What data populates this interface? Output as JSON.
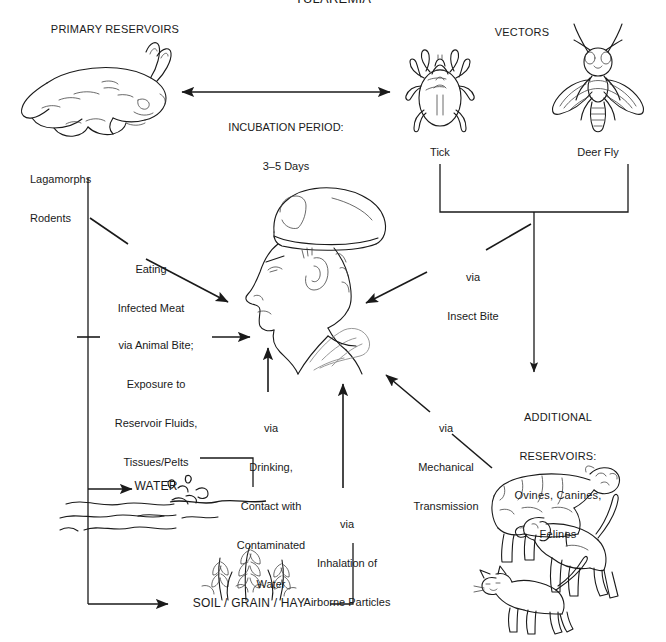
{
  "title": "TULAREMIA",
  "sections": {
    "primary_reservoirs": "PRIMARY RESERVOIRS",
    "vectors": "VECTORS",
    "additional_reservoirs_line1": "ADDITIONAL",
    "additional_reservoirs_line2": "RESERVOIRS:",
    "additional_reservoirs_line3": "Ovines, Canines,",
    "additional_reservoirs_line4": "Felines"
  },
  "nodes": {
    "reservoir_caption_line1": "Lagamorphs",
    "reservoir_caption_line2": "Rodents",
    "tick": "Tick",
    "deer_fly": "Deer Fly",
    "water": "WATER",
    "soil": "SOIL / GRAIN / HAY"
  },
  "edges": {
    "incubation_line1": "INCUBATION PERIOD:",
    "incubation_line2": "3–5 Days",
    "eating_meat_line1": "Eating",
    "eating_meat_line2": "Infected Meat",
    "animal_bite_line1": "via Animal Bite;",
    "animal_bite_line2": "Exposure to",
    "animal_bite_line3": "Reservoir Fluids,",
    "animal_bite_line4": "Tissues/Pelts",
    "drinking_line1": "via",
    "drinking_line2": "Drinking,",
    "drinking_line3": "Contact with",
    "drinking_line4": "Contaminated",
    "drinking_line5": "Water",
    "inhalation_line1": "via",
    "inhalation_line2": "Inhalation of",
    "inhalation_line3": "Airborne Particles",
    "insect_bite_line1": "via",
    "insect_bite_line2": "Insect Bite",
    "mechanical_line1": "via",
    "mechanical_line2": "Mechanical",
    "mechanical_line3": "Transmission"
  },
  "figures": {
    "rabbit": "rabbit-illustration",
    "tick": "tick-illustration",
    "deer_fly": "deer-fly-illustration",
    "soldier": "soldier-head-illustration",
    "water": "water-waves-illustration",
    "grain": "grain-stalks-illustration",
    "livestock": "sheep-dog-cat-illustration"
  },
  "colors": {
    "ink": "#1a1a1a",
    "background": "#ffffff",
    "faint": "#8d8d8d"
  }
}
